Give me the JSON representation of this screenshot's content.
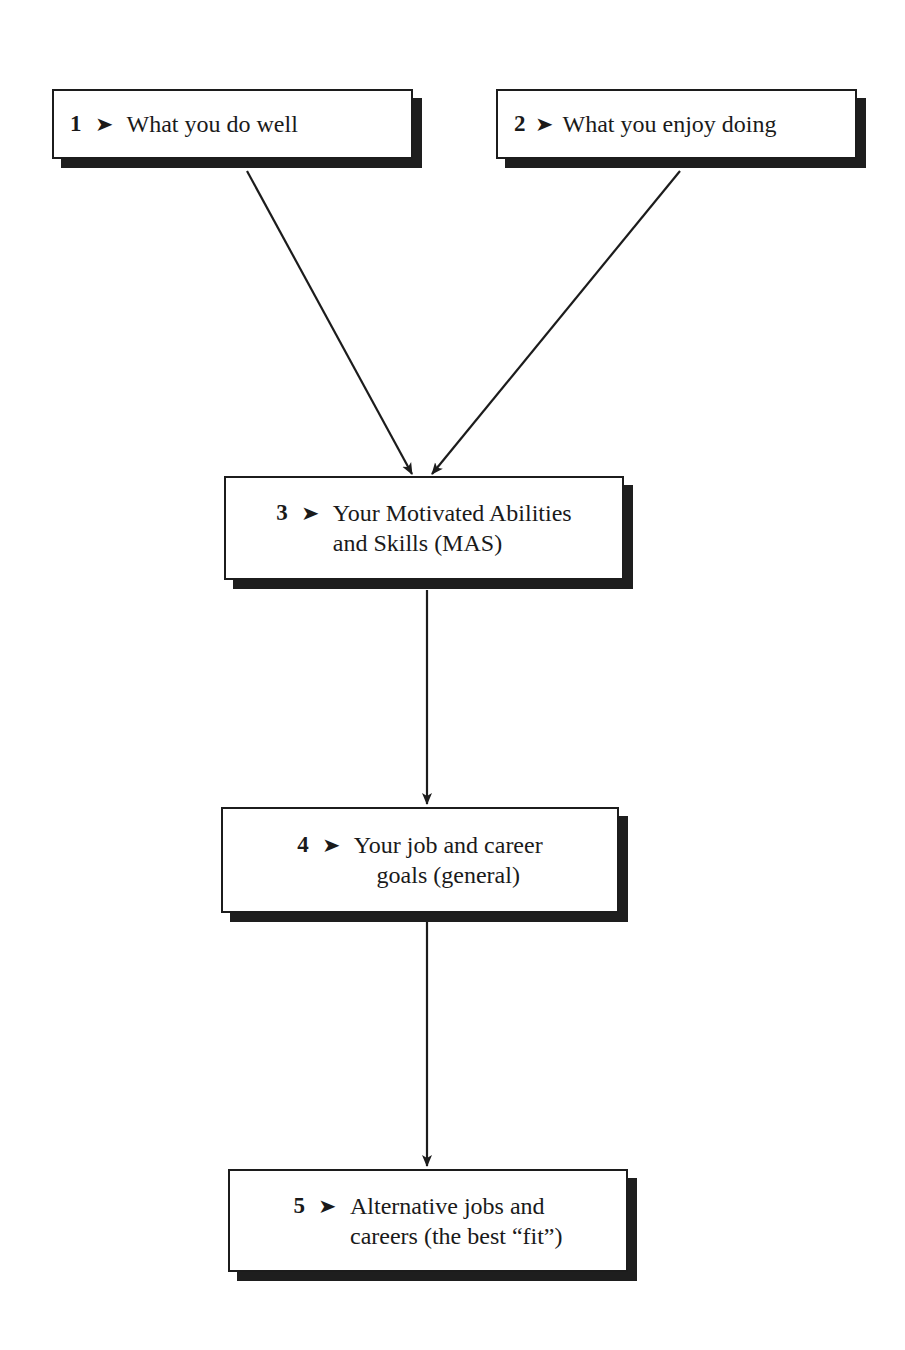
{
  "diagram": {
    "type": "flowchart",
    "colors": {
      "stroke": "#1c1c1c",
      "shadow": "#1e1e1e",
      "background": "#ffffff"
    },
    "nodes": [
      {
        "id": "1",
        "number": "1",
        "marker": "➤",
        "text": "What you do well",
        "lines": [
          "What you do well"
        ]
      },
      {
        "id": "2",
        "number": "2",
        "marker": "➤",
        "text": "What you enjoy doing",
        "lines": [
          "What you enjoy doing"
        ]
      },
      {
        "id": "3",
        "number": "3",
        "marker": "➤",
        "text": "Your Motivated Abilities and Skills (MAS)",
        "lines": [
          "Your Motivated Abilities",
          "and Skills (MAS)"
        ]
      },
      {
        "id": "4",
        "number": "4",
        "marker": "➤",
        "text": "Your job and career goals (general)",
        "lines": [
          "Your job and career",
          "goals (general)"
        ]
      },
      {
        "id": "5",
        "number": "5",
        "marker": "➤",
        "text": "Alternative jobs and careers (the best “fit”)",
        "lines": [
          "Alternative jobs and",
          "careers (the best “fit”)"
        ]
      }
    ],
    "edges": [
      {
        "from": "1",
        "to": "3"
      },
      {
        "from": "2",
        "to": "3"
      },
      {
        "from": "3",
        "to": "4"
      },
      {
        "from": "4",
        "to": "5"
      }
    ]
  }
}
